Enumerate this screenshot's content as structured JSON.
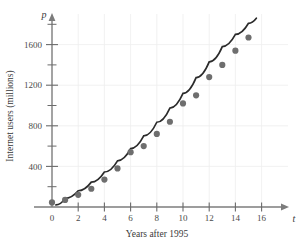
{
  "chart_data": {
    "type": "scatter",
    "title": "",
    "subtitle": "",
    "xlabel": "Years after 1995",
    "ylabel": "Internet users (millions)",
    "x_axis_variable": "t",
    "y_axis_variable": "p",
    "xlim": [
      0,
      17.5
    ],
    "ylim": [
      0,
      1900
    ],
    "x_ticks": [
      0,
      2,
      4,
      6,
      8,
      10,
      12,
      14,
      16
    ],
    "x_tick_labels": [
      "0",
      "2",
      "4",
      "6",
      "8",
      "10",
      "12",
      "14",
      "16"
    ],
    "x_minor_ticks": [
      1,
      3,
      5,
      7,
      9,
      11,
      13,
      15
    ],
    "y_ticks": [
      400,
      800,
      1200,
      1600
    ],
    "y_tick_labels": [
      "400",
      "800",
      "1200",
      "1600"
    ],
    "y_minor_ticks": [
      200,
      600,
      1000,
      1400,
      1800
    ],
    "grid": true,
    "grid_color": "#ededed",
    "legend": "none",
    "point_color": "#6e6e6e",
    "curve_color": "#2b2b2b",
    "axis_color": "#7c7c7c",
    "x": [
      0,
      1,
      2,
      3,
      4,
      5,
      6,
      7,
      8,
      9,
      10,
      11,
      12,
      13,
      14,
      15
    ],
    "values": [
      45,
      70,
      120,
      180,
      270,
      380,
      540,
      600,
      720,
      840,
      1020,
      1100,
      1280,
      1400,
      1540,
      1670
    ],
    "series": [
      {
        "name": "Internet users",
        "values": [
          45,
          70,
          120,
          180,
          270,
          380,
          540,
          600,
          720,
          840,
          1020,
          1100,
          1280,
          1400,
          1540,
          1670
        ]
      }
    ],
    "fit_curve": {
      "name": "model curve",
      "x": [
        0.3,
        1,
        2,
        3,
        4,
        5,
        6,
        7,
        8,
        9,
        10,
        11,
        12,
        13,
        14,
        15,
        15.6
      ],
      "y": [
        20,
        85,
        160,
        245,
        345,
        455,
        575,
        700,
        835,
        975,
        1120,
        1275,
        1430,
        1580,
        1700,
        1810,
        1860
      ]
    }
  }
}
